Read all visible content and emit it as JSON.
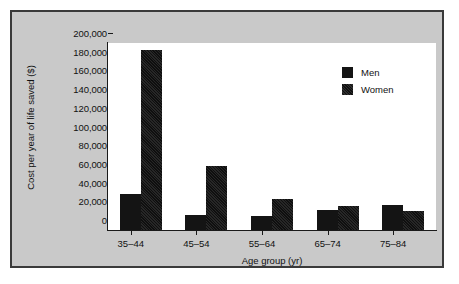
{
  "chart_data": {
    "type": "bar",
    "title": "",
    "xlabel": "Age group (yr)",
    "ylabel": "Cost per year of life saved ($)",
    "categories": [
      "35–44",
      "45–54",
      "55–64",
      "65–74",
      "75–84"
    ],
    "series": [
      {
        "name": "Men",
        "values": [
          38000,
          16000,
          15000,
          21000,
          27000
        ]
      },
      {
        "name": "Women",
        "values": [
          192000,
          68000,
          33000,
          26000,
          20000
        ]
      }
    ],
    "ylim": [
      0,
      200000
    ],
    "ytick_labels": [
      "200,000",
      "180,000",
      "160,000",
      "140,000",
      "120,000",
      "100,000",
      "80,000",
      "60,000",
      "40,000",
      "20,000",
      "0"
    ],
    "ytick_values": [
      200000,
      180000,
      160000,
      140000,
      120000,
      100000,
      80000,
      60000,
      40000,
      20000,
      0
    ],
    "grid": false,
    "legend_position": "upper-right",
    "colors": {
      "men": "#141414",
      "women": "#141414",
      "plot_background": "#ffffff",
      "panel_background": "#c9c9c9",
      "axis": "#1a1a1a"
    }
  },
  "legend": {
    "entries": [
      {
        "label": "Men"
      },
      {
        "label": "Women"
      }
    ]
  }
}
